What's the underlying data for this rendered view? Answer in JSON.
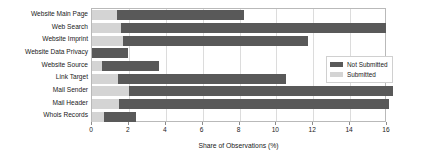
{
  "chart_data": {
    "type": "bar",
    "orientation": "horizontal",
    "stacked": true,
    "title": "",
    "xlabel": "Share of Observations (%)",
    "ylabel": "",
    "xlim": [
      0,
      16
    ],
    "xticks": [
      0,
      2,
      4,
      6,
      8,
      10,
      12,
      14,
      16
    ],
    "xtick_labels": [
      "0",
      "2",
      "4",
      "6",
      "8",
      "10",
      "12",
      "14",
      "16"
    ],
    "grid": true,
    "legend_position": "right",
    "categories": [
      "Website Main Page",
      "Web Search",
      "Website Imprint",
      "Website Data Privacy",
      "Website Source",
      "Link Target",
      "Mail Sender",
      "Mail Header",
      "Whois Records"
    ],
    "series": [
      {
        "name": "Submitted",
        "color": "#d4d4d4",
        "values": [
          1.35,
          1.55,
          1.7,
          0.0,
          0.55,
          1.4,
          2.0,
          1.45,
          0.65
        ]
      },
      {
        "name": "Not Submitted",
        "color": "#595959",
        "values": [
          6.9,
          14.4,
          10.0,
          1.95,
          3.1,
          9.1,
          14.3,
          14.65,
          1.75
        ]
      }
    ],
    "totals": [
      8.25,
      15.95,
      11.7,
      1.95,
      3.65,
      10.5,
      16.3,
      16.1,
      2.4
    ]
  },
  "legend": {
    "items": [
      {
        "label": "Not Submitted",
        "color": "#595959"
      },
      {
        "label": "Submitted",
        "color": "#d4d4d4"
      }
    ]
  }
}
